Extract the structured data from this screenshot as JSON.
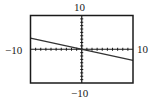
{
  "window": {
    "xmin_label": "−10",
    "xmax_label": "10",
    "ymin_label": "−10",
    "ymax_label": "10"
  },
  "chart_data": {
    "type": "line",
    "title": "",
    "xlabel": "",
    "ylabel": "",
    "xlim": [
      -10,
      10
    ],
    "ylim": [
      -10,
      10
    ],
    "xscale_ticks": 1,
    "yscale_ticks": 1,
    "grid": false,
    "axis_labels": {
      "left": "-10",
      "right": "10",
      "top": "10",
      "bottom": "-10"
    },
    "series": [
      {
        "name": "line",
        "x": [
          -10,
          10
        ],
        "y": [
          3.3,
          -3.3
        ],
        "slope": -0.33,
        "intercept": 0
      }
    ],
    "colors": {
      "frame": "#1a1a1a",
      "axis": "#1a1a1a",
      "line": "#333333"
    }
  }
}
